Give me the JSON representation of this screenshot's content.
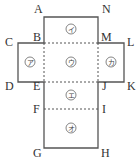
{
  "diagram": {
    "colors": {
      "line": "#555555",
      "text": "#333333",
      "background": "#ffffff"
    },
    "vertices": [
      {
        "id": "A",
        "label": "A",
        "x": 44,
        "y": 17,
        "lx": 34,
        "ly": 13
      },
      {
        "id": "N",
        "label": "N",
        "x": 98,
        "y": 17,
        "lx": 102,
        "ly": 13
      },
      {
        "id": "C",
        "label": "C",
        "x": 18,
        "y": 43,
        "lx": 5,
        "ly": 46
      },
      {
        "id": "B",
        "label": "B",
        "x": 44,
        "y": 43,
        "lx": 33,
        "ly": 41
      },
      {
        "id": "M",
        "label": "M",
        "x": 98,
        "y": 43,
        "lx": 101,
        "ly": 41
      },
      {
        "id": "L",
        "label": "L",
        "x": 124,
        "y": 43,
        "lx": 127,
        "ly": 46
      },
      {
        "id": "D",
        "label": "D",
        "x": 18,
        "y": 82,
        "lx": 5,
        "ly": 90
      },
      {
        "id": "E",
        "label": "E",
        "x": 44,
        "y": 82,
        "lx": 33,
        "ly": 90
      },
      {
        "id": "J",
        "label": "J",
        "x": 98,
        "y": 82,
        "lx": 102,
        "ly": 90
      },
      {
        "id": "K",
        "label": "K",
        "x": 124,
        "y": 82,
        "lx": 127,
        "ly": 90
      },
      {
        "id": "F",
        "label": "F",
        "x": 44,
        "y": 109,
        "lx": 33,
        "ly": 113
      },
      {
        "id": "I",
        "label": "I",
        "x": 98,
        "y": 109,
        "lx": 102,
        "ly": 113
      },
      {
        "id": "G",
        "label": "G",
        "x": 44,
        "y": 148,
        "lx": 33,
        "ly": 157
      },
      {
        "id": "H",
        "label": "H",
        "x": 98,
        "y": 148,
        "lx": 101,
        "ly": 157
      }
    ],
    "faces": [
      {
        "id": "i",
        "label": "イ",
        "circled": "㋑",
        "cx": 71,
        "cy": 29
      },
      {
        "id": "a",
        "label": "ア",
        "circled": "㋐",
        "cx": 30,
        "cy": 62
      },
      {
        "id": "u",
        "label": "ウ",
        "circled": "㋒",
        "cx": 71,
        "cy": 62
      },
      {
        "id": "ka",
        "label": "カ",
        "circled": "㋕",
        "cx": 111,
        "cy": 62
      },
      {
        "id": "e",
        "label": "エ",
        "circled": "㋓",
        "cx": 71,
        "cy": 95
      },
      {
        "id": "o",
        "label": "オ",
        "circled": "㋔",
        "cx": 71,
        "cy": 128
      }
    ],
    "solid_outline": "44,17 98,17 98,43 124,43 124,82 98,82 98,148 44,148 44,82 18,82 18,43 44,43",
    "dashed_folds": [
      {
        "name": "B-M",
        "x1": 44,
        "y1": 43,
        "x2": 98,
        "y2": 43
      },
      {
        "name": "E-J",
        "x1": 44,
        "y1": 82,
        "x2": 98,
        "y2": 82
      },
      {
        "name": "F-I",
        "x1": 44,
        "y1": 109,
        "x2": 98,
        "y2": 109
      },
      {
        "name": "B-E",
        "x1": 44,
        "y1": 43,
        "x2": 44,
        "y2": 82
      },
      {
        "name": "M-J",
        "x1": 98,
        "y1": 43,
        "x2": 98,
        "y2": 82
      }
    ]
  }
}
